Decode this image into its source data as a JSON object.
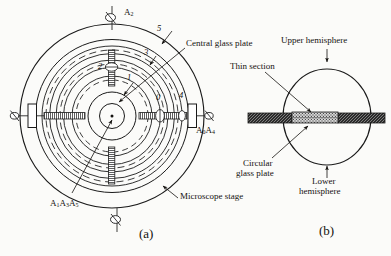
{
  "figure": {
    "panels": [
      {
        "id": "a",
        "caption": "(a)",
        "view": "plan view of microscope stage with concentric rotation axes"
      },
      {
        "id": "b",
        "caption": "(b)",
        "view": "sectional view of spherical universal stage"
      }
    ]
  },
  "panel_a": {
    "caption": "(a)",
    "axis_labels": [
      {
        "name": "A2",
        "base": "A",
        "sub": "2",
        "position": "top"
      },
      {
        "name": "A0A4",
        "base": "A",
        "sub": "0",
        "base2": "A",
        "sub2": "4",
        "position": "right"
      },
      {
        "name": "A1A3A5",
        "base": "A",
        "sub": "1",
        "base2": "A",
        "sub2": "3",
        "base3": "A",
        "sub3": "5",
        "position": "bottom-left"
      }
    ],
    "axis_text": {
      "a2": "A",
      "a2_sub": "2",
      "a0a4_1": "A",
      "a0a4_sub1": "0",
      "a0a4_2": "A",
      "a0a4_sub2": "4",
      "a1a3a5_1": "A",
      "a1a3a5_sub1": "1",
      "a1a3a5_2": "A",
      "a1a3a5_sub2": "3",
      "a1a3a5_3": "A",
      "a1a3a5_sub3": "5"
    },
    "ring_numbers": [
      {
        "label": "0",
        "x": 159,
        "y": 98
      },
      {
        "label": "1",
        "x": 129,
        "y": 78
      },
      {
        "label": "2",
        "x": 102,
        "y": 66
      },
      {
        "label": "3",
        "x": 146,
        "y": 53
      },
      {
        "label": "4",
        "x": 181,
        "y": 96
      },
      {
        "label": "5",
        "x": 159,
        "y": 29
      }
    ],
    "callouts": [
      {
        "text": "Central glass plate",
        "x": 186,
        "y": 43
      },
      {
        "text": "Microscope stage",
        "x": 180,
        "y": 196
      }
    ]
  },
  "panel_b": {
    "caption": "(b)",
    "callouts": [
      {
        "text": "Upper hemisphere",
        "x": 281,
        "y": 40
      },
      {
        "text": "Thin section",
        "x": 236,
        "y": 66
      },
      {
        "text": "Circular",
        "x": 243,
        "y": 163
      },
      {
        "text": "glass plate",
        "x": 236,
        "y": 173
      },
      {
        "text": "Lower",
        "x": 318,
        "y": 180
      },
      {
        "text": "hemisphere",
        "x": 304,
        "y": 190
      }
    ]
  },
  "colors": {
    "ink": "#14120f",
    "line": "#1a1a1a",
    "dark_plate": "#262626",
    "section_fill": "#9a9a9a",
    "paper": "#fbfbf9"
  }
}
